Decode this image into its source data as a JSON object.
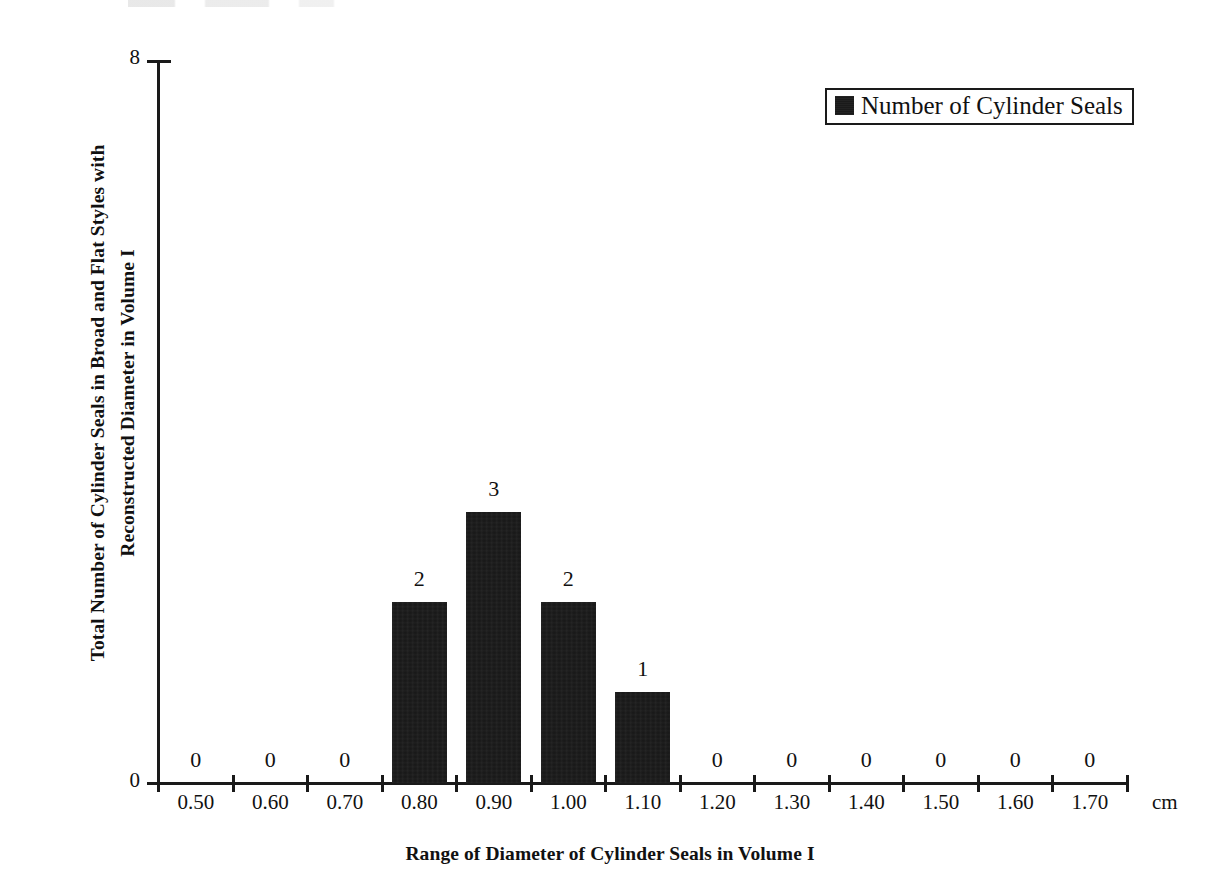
{
  "chart_data": {
    "type": "bar",
    "title": "",
    "subtitle": "",
    "xlabel": "Range of Diameter of Cylinder Seals in Volume I",
    "ylabel": "Total Number of Cylinder Seals in Broad and Flat Styles with Reconstructed Diameter in Volume I",
    "ylabel_line1": "Total Number of Cylinder Seals in Broad and Flat Styles with",
    "ylabel_line2": "Reconstructed Diameter in Volume I",
    "x_unit": "cm",
    "categories": [
      "0.50",
      "0.60",
      "0.70",
      "0.80",
      "0.90",
      "1.00",
      "1.10",
      "1.20",
      "1.30",
      "1.40",
      "1.50",
      "1.60",
      "1.70"
    ],
    "values": [
      0,
      0,
      0,
      2,
      3,
      2,
      1,
      0,
      0,
      0,
      0,
      0,
      0
    ],
    "data_labels": [
      "0",
      "0",
      "0",
      "2",
      "3",
      "2",
      "1",
      "0",
      "0",
      "0",
      "0",
      "0",
      "0"
    ],
    "ylim": [
      0,
      8
    ],
    "ytick_labels": [
      "0",
      "8"
    ],
    "ytick_values": [
      0,
      8
    ],
    "grid": false,
    "legend": {
      "position": "top-right",
      "entries": [
        {
          "label": "Number of Cylinder Seals",
          "color": "#161616",
          "marker": "square-swatch"
        }
      ]
    },
    "series": [
      {
        "name": "Number of Cylinder Seals",
        "color": "#161616",
        "values": [
          0,
          0,
          0,
          2,
          3,
          2,
          1,
          0,
          0,
          0,
          0,
          0,
          0
        ]
      }
    ],
    "colors": {
      "bar": "#161616",
      "axis": "#1a1a1a",
      "text": "#111111",
      "background": "#ffffff"
    }
  }
}
